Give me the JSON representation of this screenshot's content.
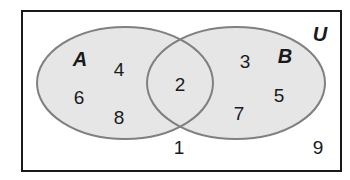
{
  "diagram": {
    "type": "venn",
    "universe_label": "U",
    "sets": [
      {
        "label": "A",
        "only": [
          "4",
          "6",
          "8"
        ]
      },
      {
        "label": "B",
        "only": [
          "3",
          "5",
          "7"
        ]
      }
    ],
    "intersection": [
      "2"
    ],
    "outside": [
      "1",
      "9"
    ],
    "colors": {
      "fill": "#e6e6e6",
      "stroke": "#808080",
      "border": "#1a1a1a"
    }
  }
}
